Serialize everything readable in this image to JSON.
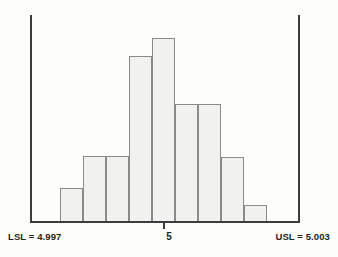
{
  "chart_data": {
    "type": "bar",
    "title": "",
    "subtitle": "",
    "xlabel": "",
    "ylabel": "",
    "grid": false,
    "legend": null,
    "categories": [
      "1",
      "2",
      "3",
      "4",
      "5",
      "6",
      "7",
      "8",
      "9"
    ],
    "values": [
      18,
      35,
      35,
      89,
      99,
      63,
      63,
      35,
      9
    ],
    "bar_top_px": [
      188,
      156,
      156,
      56,
      38,
      104,
      104,
      157,
      205
    ],
    "bar_left_px": [
      60,
      83,
      106,
      129,
      152,
      175,
      198,
      221,
      244
    ],
    "bar_width_px": 23,
    "baseline_px": 222,
    "ylim": [
      0,
      100
    ],
    "xlim": [
      4.997,
      5.003
    ],
    "bar_fill_color": "#f1f1ef",
    "bar_border_color": "#8a8a8a",
    "axis_color": "#3d3d3d",
    "background_color": "#fdfdfb",
    "annotations": [
      {
        "name": "lsl",
        "text": "LSL = 4.997",
        "value": 4.997,
        "position": "bottom-left"
      },
      {
        "name": "center",
        "text": "5",
        "value": 5,
        "position": "bottom-center"
      },
      {
        "name": "usl",
        "text": "USL = 5.003",
        "value": 5.003,
        "position": "bottom-right"
      }
    ],
    "spec_lines": [
      {
        "name": "lsl-line",
        "x_px": 30,
        "value": 4.997
      },
      {
        "name": "usl-line",
        "x_px": 298,
        "value": 5.003
      }
    ]
  },
  "axis": {
    "lsl_label": "LSL = 4.997",
    "center_label": "5",
    "usl_label": "USL = 5.003"
  }
}
